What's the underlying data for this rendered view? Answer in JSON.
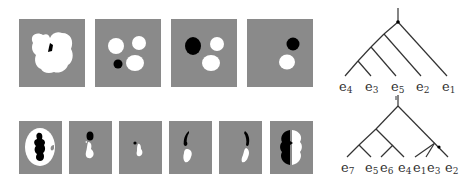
{
  "figure": {
    "top_row": {
      "panels": [
        {
          "id": "top-1",
          "content": "white four-lobed blob with small black fragment"
        },
        {
          "id": "top-2",
          "content": "three white circles and one small black circle"
        },
        {
          "id": "top-3",
          "content": "one large black circle and two white circles"
        },
        {
          "id": "top-4",
          "content": "one black circle above one white circle"
        }
      ],
      "tree": {
        "leaves": [
          {
            "base": "e",
            "sub": "4"
          },
          {
            "base": "e",
            "sub": "3"
          },
          {
            "base": "e",
            "sub": "5"
          },
          {
            "base": "e",
            "sub": "2"
          },
          {
            "base": "e",
            "sub": "1"
          }
        ]
      }
    },
    "bottom_row": {
      "panels": [
        {
          "id": "bottom-1",
          "content": "white oval ring with black central region"
        },
        {
          "id": "bottom-2",
          "content": "small black blob above white blob"
        },
        {
          "id": "bottom-3",
          "content": "tiny black dot beside small white blob"
        },
        {
          "id": "bottom-4",
          "content": "black crescent above white crescent, left"
        },
        {
          "id": "bottom-5",
          "content": "black crescent above white crescent, right"
        },
        {
          "id": "bottom-6",
          "content": "black left half and white right half"
        }
      ],
      "tree": {
        "leaves": [
          {
            "base": "e",
            "sub": "7"
          },
          {
            "base": "e",
            "sub": "5"
          },
          {
            "base": "e",
            "sub": "6"
          },
          {
            "base": "e",
            "sub": "4"
          },
          {
            "base": "e",
            "sub": "1"
          },
          {
            "base": "e",
            "sub": "3"
          },
          {
            "base": "e",
            "sub": "2"
          }
        ]
      }
    },
    "colors": {
      "panel_bg": "#8a8a8a",
      "shape_white": "#ffffff",
      "shape_black": "#000000",
      "tree_line": "#333333"
    }
  }
}
